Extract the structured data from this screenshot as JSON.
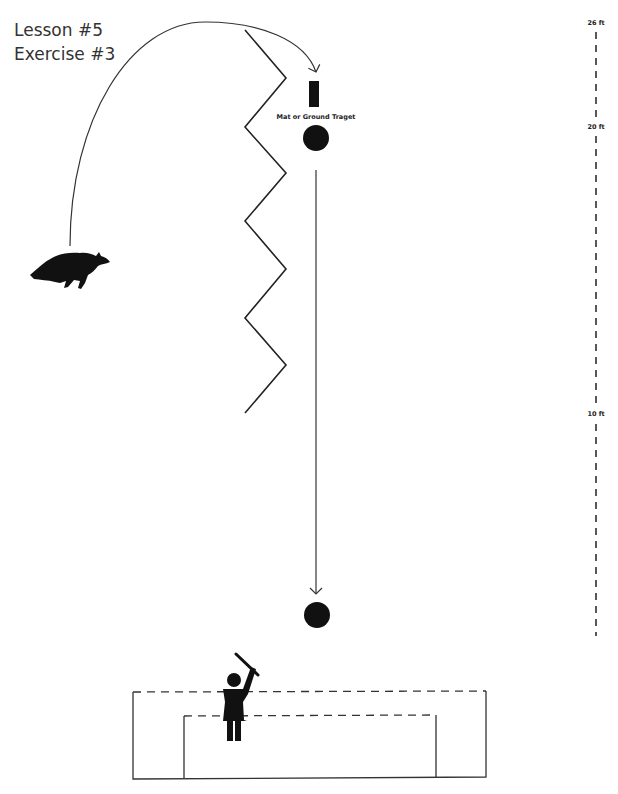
{
  "title": {
    "lesson": "Lesson #5",
    "exercise": "Exercise #3"
  },
  "target": {
    "label": "Mat or Ground Traget"
  },
  "distance_scale": {
    "unit": "ft",
    "marks": [
      {
        "label": "26 ft",
        "value": 26
      },
      {
        "label": "20 ft",
        "value": 20
      },
      {
        "label": "10 ft",
        "value": 10
      }
    ]
  },
  "elements": {
    "dog": "running dog silhouette",
    "handler": "handler with raised stick",
    "zigzag": "zigzag barrier line",
    "path_arc": "dog path arc to target",
    "recall_arrow": "straight path from target circle to handler circle",
    "enclosure": "dashed-top handler enclosure"
  },
  "colors": {
    "ink": "#111111",
    "line": "#222222",
    "text": "#333333"
  }
}
